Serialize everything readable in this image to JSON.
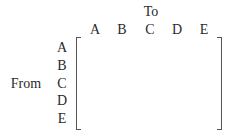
{
  "matrix": {
    "column_axis_label": "To",
    "row_axis_label": "From",
    "columns": [
      "A",
      "B",
      "C",
      "D",
      "E"
    ],
    "rows": [
      "A",
      "B",
      "C",
      "D",
      "E"
    ],
    "cells": []
  }
}
